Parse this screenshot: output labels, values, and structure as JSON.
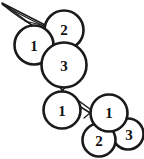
{
  "image": {
    "title": "Hand-drawn numbered berry cluster diagram",
    "width": 144,
    "height": 159,
    "background_color": "#ffffff",
    "ink_color": "#1a1a1a"
  },
  "diagram": {
    "type": "line-drawing",
    "berry_count": 6,
    "berries": [
      {
        "id": "berry-upper-left",
        "label": "1",
        "cx": 34,
        "cy": 45,
        "r": 19.5,
        "group": "upper-cluster"
      },
      {
        "id": "berry-top",
        "label": "2",
        "cx": 64,
        "cy": 30,
        "r": 19.5,
        "group": "upper-cluster"
      },
      {
        "id": "berry-center",
        "label": "3",
        "cx": 64,
        "cy": 65,
        "r": 22.5,
        "group": "upper-cluster"
      },
      {
        "id": "berry-middle",
        "label": "1",
        "cx": 62,
        "cy": 110,
        "r": 18.5,
        "group": "middle"
      },
      {
        "id": "berry-lower-right-top",
        "label": "1",
        "cx": 109,
        "cy": 113,
        "r": 18.5,
        "group": "lower-cluster"
      },
      {
        "id": "berry-lower-right-bottom",
        "label": "2",
        "cx": 99,
        "cy": 140,
        "r": 16.5,
        "group": "lower-cluster"
      },
      {
        "id": "berry-lower-right-side",
        "label": "3",
        "cx": 128,
        "cy": 134,
        "r": 15.5,
        "group": "lower-cluster"
      }
    ],
    "stems": [
      {
        "id": "stem-main-top",
        "description": "thin double-line stem entering from top-left corner toward upper-left berry"
      },
      {
        "id": "stem-center-to-middle",
        "description": "short crossed stem linking center berry 3 to middle berry 1"
      },
      {
        "id": "stem-middle-to-lower",
        "description": "short stem linking middle berry 1 to lower-right cluster"
      }
    ]
  }
}
